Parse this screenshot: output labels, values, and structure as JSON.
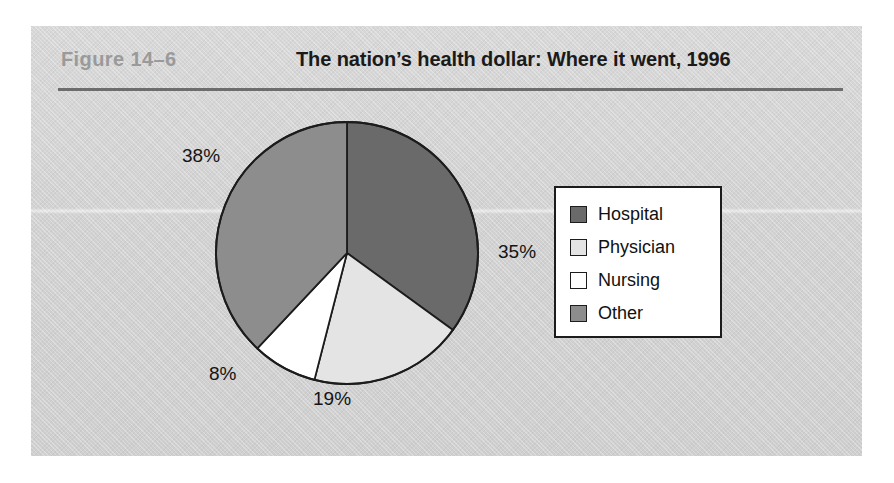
{
  "figure": {
    "number_label": "Figure  14–6",
    "title": "The nation’s health dollar: Where it went, 1996"
  },
  "colors": {
    "panel_background": "#d2d2d2",
    "rule": "#6d6d6d",
    "figure_number_text": "#9a9a9a",
    "title_text": "#1a1a1a",
    "outline": "#1c1c1c",
    "legend_background": "#ffffff"
  },
  "legend": {
    "position": "right",
    "items": [
      {
        "label": "Hospital",
        "color": "#6a6a6a",
        "swatch_name": "legend-swatch-hospital"
      },
      {
        "label": "Physician",
        "color": "#e4e4e4",
        "swatch_name": "legend-swatch-physician"
      },
      {
        "label": "Nursing",
        "color": "#ffffff",
        "swatch_name": "legend-swatch-nursing"
      },
      {
        "label": "Other",
        "color": "#8d8d8d",
        "swatch_name": "legend-swatch-other"
      }
    ]
  },
  "labels": {
    "other": "38%",
    "hospital": "35%",
    "nursing": "8%",
    "physician": "19%"
  },
  "chart_data": {
    "type": "pie",
    "title": "The nation’s health dollar: Where it went, 1996",
    "subtitle": "",
    "xlabel": "",
    "ylabel": "",
    "unit": "percent",
    "start_angle_deg": 0,
    "direction": "clockwise",
    "grid": false,
    "legend_position": "right",
    "categories": [
      "Hospital",
      "Physician",
      "Nursing",
      "Other"
    ],
    "values": [
      35,
      19,
      8,
      38
    ],
    "data_labels": [
      "35%",
      "19%",
      "8%",
      "38%"
    ],
    "slice_colors": [
      "#6a6a6a",
      "#e4e4e4",
      "#ffffff",
      "#8d8d8d"
    ],
    "slices": [
      {
        "name": "Hospital",
        "value": 35,
        "label": "35%",
        "color": "#6a6a6a",
        "start_deg": 0,
        "end_deg": 126.0
      },
      {
        "name": "Physician",
        "value": 19,
        "label": "19%",
        "color": "#e4e4e4",
        "start_deg": 126.0,
        "end_deg": 194.4
      },
      {
        "name": "Nursing",
        "value": 8,
        "label": "8%",
        "color": "#ffffff",
        "start_deg": 194.4,
        "end_deg": 223.2
      },
      {
        "name": "Other",
        "value": 38,
        "label": "38%",
        "color": "#8d8d8d",
        "start_deg": 223.2,
        "end_deg": 360.0
      }
    ]
  }
}
